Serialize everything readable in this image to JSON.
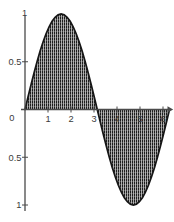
{
  "figure": {
    "background": "#ffffff",
    "curve_color": "#161616",
    "axis_color": "#4a4a4a",
    "label_color": "#3a3a3a",
    "hatch_dark": "#1d1d1d",
    "hatch_light": "#b0b0b0",
    "hatch_dot_gap": "#d8d8d8"
  },
  "chart_data": {
    "type": "area",
    "title": "",
    "xlabel": "",
    "ylabel": "",
    "xlim": [
      0,
      6.2832
    ],
    "ylim": [
      -1,
      1
    ],
    "grid": false,
    "fill_style": "vertical-hatch",
    "origin_label": "0",
    "x_ticks": [
      {
        "value": 1,
        "label": "1"
      },
      {
        "value": 2,
        "label": "2"
      },
      {
        "value": 3,
        "label": "3"
      },
      {
        "value": 4,
        "label": "4"
      },
      {
        "value": 5,
        "label": "5"
      },
      {
        "value": 6,
        "label": "6"
      }
    ],
    "y_ticks": [
      {
        "value": 1,
        "label": "1",
        "tick": false
      },
      {
        "value": 0.5,
        "label": "0.5",
        "tick": true
      },
      {
        "value": -0.5,
        "label": "0.5",
        "tick": true
      },
      {
        "value": -1,
        "label": "1",
        "tick": true
      }
    ],
    "series": [
      {
        "name": "sin(x)",
        "x_start": 0,
        "x_step": 0.1309,
        "y": [
          0,
          0.1305,
          0.2588,
          0.3827,
          0.5,
          0.6088,
          0.7071,
          0.7934,
          0.866,
          0.9239,
          0.9659,
          0.9914,
          1,
          0.9914,
          0.9659,
          0.9239,
          0.866,
          0.7934,
          0.7071,
          0.6088,
          0.5,
          0.3827,
          0.2588,
          0.1305,
          0,
          -0.1305,
          -0.2588,
          -0.3827,
          -0.5,
          -0.6088,
          -0.7071,
          -0.7934,
          -0.866,
          -0.9239,
          -0.9659,
          -0.9914,
          -1,
          -0.9914,
          -0.9659,
          -0.9239,
          -0.866,
          -0.7934,
          -0.7071,
          -0.6088,
          -0.5,
          -0.3827,
          -0.2588,
          -0.1305,
          0
        ]
      }
    ]
  }
}
